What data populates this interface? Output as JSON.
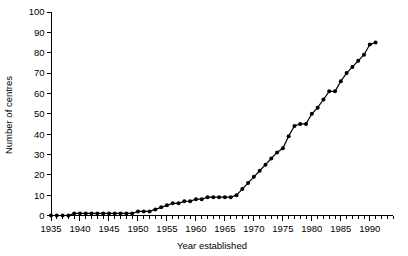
{
  "chart_data": {
    "type": "line",
    "title": "",
    "subtitle": "",
    "xlabel": "Year established",
    "ylabel": "Number of centres",
    "xlim": [
      1935,
      1994
    ],
    "ylim": [
      0,
      100
    ],
    "grid": false,
    "legend": null,
    "marker": "filled-circle",
    "line_color": "#000000",
    "marker_color": "#000000",
    "x_major_ticks": [
      1935,
      1940,
      1945,
      1950,
      1955,
      1960,
      1965,
      1970,
      1975,
      1980,
      1985,
      1990
    ],
    "x_major_tick_labels": [
      "1935",
      "1940",
      "1945",
      "1950",
      "1955",
      "1960",
      "1965",
      "1970",
      "1975",
      "1980",
      "1985",
      "1990"
    ],
    "x_minor_tick_step": 1,
    "y_ticks": [
      0,
      10,
      20,
      30,
      40,
      50,
      60,
      70,
      80,
      90,
      100
    ],
    "y_tick_labels": [
      "0",
      "10",
      "20",
      "30",
      "40",
      "50",
      "60",
      "70",
      "80",
      "90",
      "100"
    ],
    "x": [
      1935,
      1936,
      1937,
      1938,
      1939,
      1940,
      1941,
      1942,
      1943,
      1944,
      1945,
      1946,
      1947,
      1948,
      1949,
      1950,
      1951,
      1952,
      1953,
      1954,
      1955,
      1956,
      1957,
      1958,
      1959,
      1960,
      1961,
      1962,
      1963,
      1964,
      1965,
      1966,
      1967,
      1968,
      1969,
      1970,
      1971,
      1972,
      1973,
      1974,
      1975,
      1976,
      1977,
      1978,
      1979,
      1980,
      1981,
      1982,
      1983,
      1984,
      1985,
      1986,
      1987,
      1988,
      1989,
      1990,
      1991
    ],
    "values": [
      0,
      0,
      0,
      0,
      1,
      1,
      1,
      1,
      1,
      1,
      1,
      1,
      1,
      1,
      1,
      2,
      2,
      2,
      3,
      4,
      5,
      6,
      6,
      7,
      7,
      8,
      8,
      9,
      9,
      9,
      9,
      9,
      10,
      13,
      16,
      19,
      22,
      25,
      28,
      31,
      33,
      39,
      44,
      45,
      45,
      50,
      53,
      57,
      61,
      61,
      66,
      70,
      73,
      76,
      79,
      84,
      85
    ],
    "series": [
      {
        "name": "Number of centres",
        "values": [
          0,
          0,
          0,
          0,
          1,
          1,
          1,
          1,
          1,
          1,
          1,
          1,
          1,
          1,
          1,
          2,
          2,
          2,
          3,
          4,
          5,
          6,
          6,
          7,
          7,
          8,
          8,
          9,
          9,
          9,
          9,
          9,
          10,
          13,
          16,
          19,
          22,
          25,
          28,
          31,
          33,
          39,
          44,
          45,
          45,
          50,
          53,
          57,
          61,
          61,
          66,
          70,
          73,
          76,
          79,
          84,
          85
        ]
      }
    ]
  },
  "figure": {
    "background": "#ffffff",
    "foreground": "#000000"
  }
}
